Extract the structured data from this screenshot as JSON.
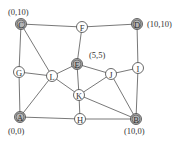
{
  "diagram": {
    "type": "graph",
    "nodes": [
      {
        "id": "C",
        "x": 21,
        "y": 24,
        "shaded": true
      },
      {
        "id": "F",
        "x": 82,
        "y": 27,
        "shaded": false
      },
      {
        "id": "D",
        "x": 137,
        "y": 24,
        "shaded": true
      },
      {
        "id": "G",
        "x": 19,
        "y": 72,
        "shaded": false
      },
      {
        "id": "L",
        "x": 52,
        "y": 76,
        "shaded": false
      },
      {
        "id": "E",
        "x": 77,
        "y": 64,
        "shaded": true
      },
      {
        "id": "J",
        "x": 111,
        "y": 74,
        "shaded": false
      },
      {
        "id": "I",
        "x": 138,
        "y": 68,
        "shaded": false
      },
      {
        "id": "K",
        "x": 79,
        "y": 95,
        "shaded": false
      },
      {
        "id": "A",
        "x": 20,
        "y": 117,
        "shaded": true
      },
      {
        "id": "H",
        "x": 80,
        "y": 119,
        "shaded": false
      },
      {
        "id": "B",
        "x": 136,
        "y": 119,
        "shaded": true
      }
    ],
    "edges": [
      [
        "C",
        "F"
      ],
      [
        "F",
        "D"
      ],
      [
        "C",
        "G"
      ],
      [
        "C",
        "L"
      ],
      [
        "F",
        "E"
      ],
      [
        "D",
        "I"
      ],
      [
        "G",
        "L"
      ],
      [
        "G",
        "A"
      ],
      [
        "L",
        "E"
      ],
      [
        "L",
        "A"
      ],
      [
        "L",
        "K"
      ],
      [
        "E",
        "J"
      ],
      [
        "E",
        "K"
      ],
      [
        "J",
        "I"
      ],
      [
        "J",
        "K"
      ],
      [
        "J",
        "B"
      ],
      [
        "I",
        "B"
      ],
      [
        "K",
        "H"
      ],
      [
        "K",
        "B"
      ],
      [
        "A",
        "H"
      ],
      [
        "H",
        "B"
      ]
    ],
    "coordinate_labels": [
      {
        "text": "(0,10)",
        "x": 8,
        "y": 15
      },
      {
        "text": "(10,10)",
        "x": 147,
        "y": 27
      },
      {
        "text": "(5,5)",
        "x": 89,
        "y": 58
      },
      {
        "text": "(0,0)",
        "x": 8,
        "y": 134
      },
      {
        "text": "(10,0)",
        "x": 124,
        "y": 134
      }
    ]
  }
}
